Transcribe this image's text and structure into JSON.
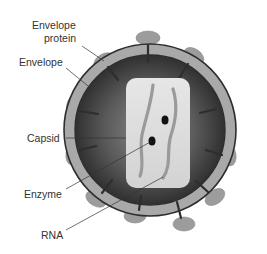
{
  "diagram": {
    "labels": {
      "envelope_protein_line1": "Envelope",
      "envelope_protein_line2": "protein",
      "envelope": "Envelope",
      "capsid": "Capsid",
      "enzyme": "Enzyme",
      "rna": "RNA"
    },
    "colors": {
      "background": "#ffffff",
      "envelope_band": "#a9a9a9",
      "envelope_outline": "#2e2e2e",
      "interior_dark": "#2b2b2b",
      "interior_mid": "#6a6a6a",
      "capsid_fill": "#dcdcdc",
      "rna_strand": "#9a9a9a",
      "enzyme_dot": "#111111",
      "protein_spike": "#9c9c9c",
      "leader_line": "#333333",
      "label_text": "#333333"
    }
  }
}
